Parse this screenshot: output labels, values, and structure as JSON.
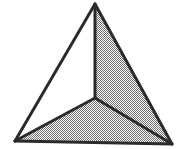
{
  "figure": {
    "shape_type": "triangle",
    "background_color": "#ffffff",
    "stroke_color": "#2b2b2b",
    "stroke_width": 3,
    "fill_color": "#a9a9a9",
    "fill_style": "dithered-gray-halftone",
    "empty_color": "#ffffff",
    "canvas": {
      "width": 186,
      "height": 149
    },
    "vertices": {
      "apex": {
        "label": "apex",
        "x": 95,
        "y": 4
      },
      "bottom_left": {
        "label": "bottom-left",
        "x": 15,
        "y": 141
      },
      "bottom_right": {
        "label": "bottom-right",
        "x": 172,
        "y": 144
      },
      "center": {
        "label": "center",
        "x": 95,
        "y": 98
      }
    },
    "regions": [
      {
        "name": "left-region",
        "filled": false,
        "fill": "#ffffff",
        "points": "95,4 15,141 95,98"
      },
      {
        "name": "right-region",
        "filled": true,
        "fill": "#a9a9a9",
        "points": "95,4 172,144 95,98"
      },
      {
        "name": "bottom-region",
        "filled": true,
        "fill": "#a9a9a9",
        "points": "15,141 172,144 95,98"
      }
    ],
    "edges": [
      {
        "name": "outer-edge-left",
        "from": "apex",
        "to": "bottom_left",
        "path": "M 95,4 L 15,141"
      },
      {
        "name": "outer-edge-right",
        "from": "apex",
        "to": "bottom_right",
        "path": "M 95,4 L 172,144"
      },
      {
        "name": "outer-edge-bottom",
        "from": "bottom_left",
        "to": "bottom_right",
        "path": "M 15,141 L 172,144"
      },
      {
        "name": "inner-edge-top",
        "from": "apex",
        "to": "center",
        "path": "M 95,4 L 95,98"
      },
      {
        "name": "inner-edge-left",
        "from": "center",
        "to": "bottom_left",
        "path": "M 95,98 L 15,141"
      },
      {
        "name": "inner-edge-right",
        "from": "center",
        "to": "bottom_right",
        "path": "M 95,98 L 172,144"
      }
    ]
  }
}
